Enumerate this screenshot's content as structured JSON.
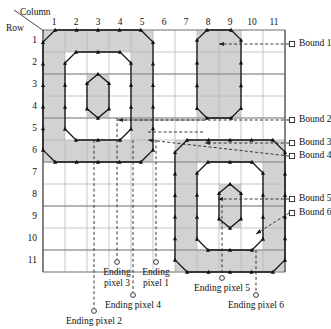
{
  "figure": {
    "axis_labels": {
      "column": "Column",
      "row": "Row"
    },
    "column_ticks": [
      "1",
      "2",
      "3",
      "4",
      "5",
      "6",
      "7",
      "8",
      "9",
      "10",
      "11"
    ],
    "row_ticks": [
      "1",
      "2",
      "3",
      "4",
      "5",
      "6",
      "7",
      "8",
      "9",
      "10",
      "11"
    ],
    "grid": {
      "cols": 11,
      "rows": 11,
      "cell": 22,
      "x0": 43,
      "y0": 30
    },
    "colors": {
      "grid_line": "#8a8a8a",
      "grid_line_minor": "#b8b8b8",
      "region_fill": "#d2d2d2",
      "contour": "#111111",
      "leader": "#222222",
      "text": "#111111"
    },
    "bound_labels": [
      {
        "id": "bound-1",
        "text": "Bound 1",
        "marker_x": 292,
        "marker_y": 44,
        "text_x": 299,
        "text_y": 39,
        "arrow_to_x": 219,
        "arrow_to_y": 44
      },
      {
        "id": "bound-2",
        "text": "Bound 2",
        "marker_x": 292,
        "marker_y": 120,
        "text_x": 299,
        "text_y": 115,
        "arrow_to_x": 118,
        "arrow_to_y": 120
      },
      {
        "id": "bound-3",
        "text": "Bound 3",
        "marker_x": 292,
        "marker_y": 143,
        "text_x": 299,
        "text_y": 138,
        "arrow_to_x": 205,
        "arrow_to_y": 143
      },
      {
        "id": "bound-4",
        "text": "Bound 4",
        "marker_x": 292,
        "marker_y": 156,
        "text_x": 299,
        "text_y": 151,
        "arrow_to_x": 148,
        "arrow_to_y": 140
      },
      {
        "id": "bound-5",
        "text": "Bound 5",
        "marker_x": 292,
        "marker_y": 199,
        "text_x": 299,
        "text_y": 194,
        "arrow_to_x": 218,
        "arrow_to_y": 199
      },
      {
        "id": "bound-6",
        "text": "Bound 6",
        "marker_x": 292,
        "marker_y": 213,
        "text_x": 299,
        "text_y": 208,
        "arrow_to_x": 256,
        "arrow_to_y": 234
      }
    ],
    "ending_pixels": [
      {
        "id": "ending-pixel-1",
        "line1": "Ending",
        "line2": "pixel 1",
        "marker_x": 156,
        "marker_y": 262,
        "text_x": 156,
        "text_y": 267,
        "stem_x": 156,
        "stem_top": 140
      },
      {
        "id": "ending-pixel-2",
        "line1": "Ending pixel 2",
        "line2": "",
        "marker_x": 94,
        "marker_y": 311,
        "text_x": 94,
        "text_y": 316,
        "stem_x": 94,
        "stem_top": 140
      },
      {
        "id": "ending-pixel-3",
        "line1": "Ending",
        "line2": "pixel 3",
        "marker_x": 117,
        "marker_y": 262,
        "text_x": 117,
        "text_y": 267,
        "stem_x": 117,
        "stem_top": 118
      },
      {
        "id": "ending-pixel-4",
        "line1": "Ending pixel 4",
        "line2": "",
        "marker_x": 133,
        "marker_y": 295,
        "text_x": 133,
        "text_y": 300,
        "stem_x": 133,
        "stem_top": 140
      },
      {
        "id": "ending-pixel-5",
        "line1": "Ending pixel 5",
        "line2": "",
        "marker_x": 222,
        "marker_y": 278,
        "text_x": 222,
        "text_y": 283,
        "stem_x": 222,
        "stem_top": 205
      },
      {
        "id": "ending-pixel-6",
        "line1": "Ending pixel 6",
        "line2": "",
        "marker_x": 256,
        "marker_y": 295,
        "text_x": 256,
        "text_y": 300,
        "stem_x": 256,
        "stem_top": 250
      }
    ]
  },
  "chart_data": {
    "type": "diagram",
    "xlabel": "Column",
    "ylabel": "Row",
    "grid": {
      "columns": 11,
      "rows": 11,
      "grid_on": true
    },
    "regions": [
      {
        "name": "region-1-top-left",
        "outer_boundary_cells": "columns 1-5, rows 1-6",
        "hole": "columns 2-4, rows 2-5 (with inner island at column 3, rows 3-4)"
      },
      {
        "name": "region-2-top-right",
        "outer_boundary_cells": "columns 8-9, rows 1-4"
      },
      {
        "name": "region-3-bottom-right",
        "outer_boundary_cells": "columns 7-11, rows 6-11",
        "hole": "columns 8-10, rows 7-10 (with inner island at column 9, rows 8-9)"
      }
    ],
    "annotations": [
      "Bound 1",
      "Bound 2",
      "Bound 3",
      "Bound 4",
      "Bound 5",
      "Bound 6",
      "Ending pixel 1",
      "Ending pixel 2",
      "Ending pixel 3",
      "Ending pixel 4",
      "Ending pixel 5",
      "Ending pixel 6"
    ]
  }
}
